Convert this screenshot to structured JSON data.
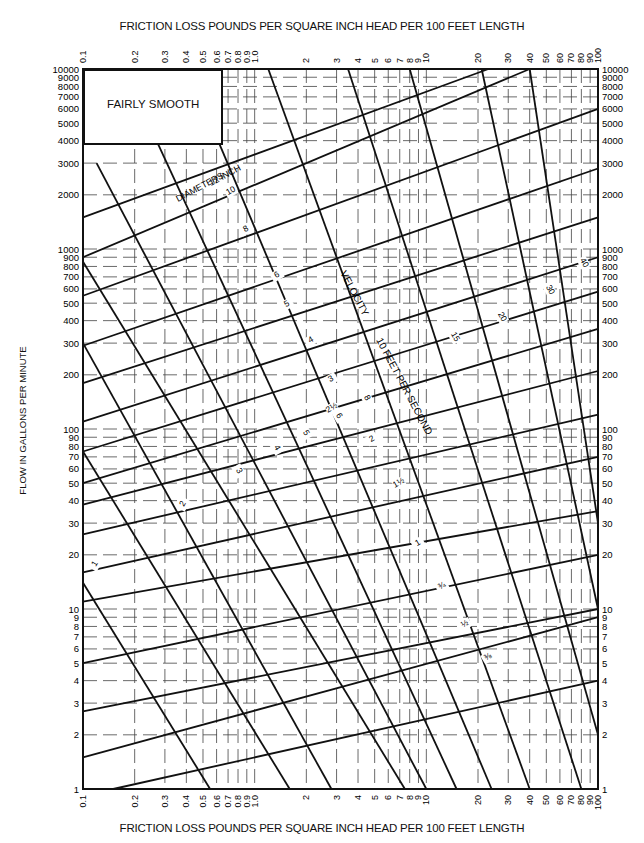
{
  "chart_data": {
    "type": "line",
    "title": "FRICTION LOSS POUNDS PER SQUARE INCH HEAD PER 100 FEET LENGTH",
    "xlabel": "FRICTION LOSS POUNDS PER SQUARE INCH HEAD PER 100 FEET LENGTH",
    "ylabel": "FLOW IN GALLONS PER MINUTE",
    "xscale": "log",
    "yscale": "log",
    "xlim": [
      0.1,
      100
    ],
    "ylim": [
      1,
      10000
    ],
    "grid": true,
    "legend": "FAIRLY SMOOTH",
    "x_ticks": [
      "0.1",
      "0.2",
      "0.3",
      "0.4",
      "0.5",
      "0.6",
      "0.7",
      "0.8",
      "0.9",
      "1.0",
      "2",
      "3",
      "4",
      "5",
      "6",
      "7",
      "8",
      "9",
      "10",
      "20",
      "30",
      "40",
      "50",
      "60",
      "70",
      "80",
      "90",
      "100"
    ],
    "y_ticks_left": [
      "10000",
      "9000",
      "8000",
      "7000",
      "6000",
      "5000",
      "4000",
      "3000",
      "2000",
      "1000",
      "900",
      "800",
      "700",
      "600",
      "500",
      "400",
      "300",
      "200",
      "100",
      "90",
      "80",
      "70",
      "60",
      "50",
      "40",
      "30",
      "20",
      "10",
      "9",
      "8",
      "7",
      "6",
      "5",
      "4",
      "3",
      "2",
      "1"
    ],
    "y_ticks_right": [
      "10000",
      "9000",
      "8000",
      "7000",
      "6000",
      "5000",
      "4000",
      "3000",
      "2000",
      "1000",
      "900",
      "800",
      "700",
      "600",
      "500",
      "400",
      "300",
      "200",
      "100",
      "90",
      "80",
      "70",
      "60",
      "50",
      "40",
      "30",
      "20",
      "10",
      "9",
      "8",
      "7",
      "6",
      "5",
      "4",
      "3",
      "2",
      "1"
    ],
    "diameter_series_label": "DIAMETERS 12 INCH",
    "velocity_series_label": "VELOCITY 10 FEET PER SECOND",
    "diameter_lines": [
      {
        "name": "12",
        "points": [
          [
            0.1,
            1500
          ],
          [
            23,
            10000
          ]
        ]
      },
      {
        "name": "10",
        "points": [
          [
            0.1,
            900
          ],
          [
            40,
            10000
          ]
        ]
      },
      {
        "name": "8",
        "points": [
          [
            0.1,
            550
          ],
          [
            100,
            6000
          ]
        ]
      },
      {
        "name": "6",
        "points": [
          [
            0.1,
            290
          ],
          [
            100,
            2800
          ]
        ]
      },
      {
        "name": "5",
        "points": [
          [
            0.1,
            180
          ],
          [
            100,
            1500
          ]
        ]
      },
      {
        "name": "4",
        "points": [
          [
            0.1,
            110
          ],
          [
            100,
            900
          ]
        ]
      },
      {
        "name": "3",
        "points": [
          [
            0.1,
            75
          ],
          [
            100,
            580
          ]
        ]
      },
      {
        "name": "2 1/2",
        "points": [
          [
            0.1,
            50
          ],
          [
            100,
            360
          ]
        ]
      },
      {
        "name": "2",
        "points": [
          [
            0.1,
            38
          ],
          [
            100,
            210
          ]
        ]
      },
      {
        "name": "1 1/2",
        "points": [
          [
            0.1,
            26
          ],
          [
            100,
            120
          ]
        ]
      },
      {
        "name": "1 1/4",
        "points": [
          [
            0.1,
            16
          ],
          [
            100,
            70
          ]
        ]
      },
      {
        "name": "1",
        "points": [
          [
            0.1,
            11
          ],
          [
            100,
            35
          ]
        ]
      },
      {
        "name": "3/4",
        "points": [
          [
            0.1,
            5
          ],
          [
            100,
            20
          ]
        ]
      },
      {
        "name": "1/2",
        "points": [
          [
            0.1,
            2.7
          ],
          [
            100,
            10
          ]
        ]
      },
      {
        "name": "3/8",
        "points": [
          [
            0.1,
            1.5
          ],
          [
            100,
            9
          ]
        ]
      },
      {
        "name": "1/4",
        "points": [
          [
            0.15,
            1
          ],
          [
            100,
            4
          ]
        ]
      }
    ],
    "velocity_lines": [
      {
        "name": "1",
        "points": [
          [
            0.1,
            14
          ],
          [
            0.55,
            1
          ]
        ]
      },
      {
        "name": "2",
        "points": [
          [
            0.1,
            75
          ],
          [
            1.6,
            1
          ]
        ]
      },
      {
        "name": "3",
        "points": [
          [
            0.1,
            300
          ],
          [
            2.8,
            1
          ]
        ]
      },
      {
        "name": "4",
        "points": [
          [
            0.1,
            850
          ],
          [
            7.5,
            1
          ]
        ]
      },
      {
        "name": "5",
        "points": [
          [
            0.12,
            3000
          ],
          [
            10,
            1
          ]
        ]
      },
      {
        "name": "6",
        "points": [
          [
            0.22,
            6000
          ],
          [
            15,
            1
          ]
        ]
      },
      {
        "name": "8",
        "points": [
          [
            0.45,
            8000
          ],
          [
            24,
            1
          ]
        ]
      },
      {
        "name": "10",
        "points": [
          [
            1.2,
            10000
          ],
          [
            40,
            1
          ]
        ]
      },
      {
        "name": "15",
        "points": [
          [
            3.5,
            10000
          ],
          [
            80,
            1
          ]
        ]
      },
      {
        "name": "20",
        "points": [
          [
            8,
            10000
          ],
          [
            100,
            2
          ]
        ]
      },
      {
        "name": "30",
        "points": [
          [
            21,
            10000
          ],
          [
            100,
            10
          ]
        ]
      },
      {
        "name": "40",
        "points": [
          [
            40,
            10000
          ],
          [
            100,
            30
          ]
        ]
      }
    ]
  },
  "text_labels": {
    "title_top": "FRICTION LOSS POUNDS PER SQUARE INCH HEAD PER 100 FEET LENGTH",
    "title_bottom": "FRICTION LOSS POUNDS PER SQUARE INCH HEAD PER 100 FEET LENGTH",
    "ylabel": "FLOW IN GALLONS PER MINUTE",
    "legend": "FAIRLY SMOOTH",
    "diameters": "DIAMETERS",
    "twelve_inch": "12   INCH",
    "velocity": "VELOCITY",
    "ten_feet_per_second": "10   FEET   PER   SECOND"
  },
  "line_labels": [
    {
      "text": "10",
      "x": 232,
      "y": 193,
      "rot": -30
    },
    {
      "text": "8",
      "x": 247,
      "y": 231,
      "rot": -30
    },
    {
      "text": "6",
      "x": 278,
      "y": 277,
      "rot": -30
    },
    {
      "text": "5",
      "x": 288,
      "y": 306,
      "rot": -30
    },
    {
      "text": "4",
      "x": 312,
      "y": 342,
      "rot": -30
    },
    {
      "text": "3",
      "x": 332,
      "y": 381,
      "rot": -30
    },
    {
      "text": "2½",
      "x": 333,
      "y": 410,
      "rot": -30
    },
    {
      "text": "2",
      "x": 373,
      "y": 441,
      "rot": -30
    },
    {
      "text": "1½",
      "x": 400,
      "y": 485,
      "rot": -30
    },
    {
      "text": "1",
      "x": 419,
      "y": 545,
      "rot": -30
    },
    {
      "text": "¾",
      "x": 443,
      "y": 588,
      "rot": -30
    },
    {
      "text": "½",
      "x": 466,
      "y": 626,
      "rot": -30
    },
    {
      "text": "⅜",
      "x": 489,
      "y": 659,
      "rot": -30
    },
    {
      "text": "1",
      "x": 97,
      "y": 565,
      "rot": -60
    },
    {
      "text": "2",
      "x": 185,
      "y": 505,
      "rot": -60
    },
    {
      "text": "3",
      "x": 237,
      "y": 472,
      "rot": 60
    },
    {
      "text": "4",
      "x": 275,
      "y": 449,
      "rot": 60
    },
    {
      "text": "5",
      "x": 304,
      "y": 434,
      "rot": 60
    },
    {
      "text": "6",
      "x": 337,
      "y": 417,
      "rot": 60
    },
    {
      "text": "8",
      "x": 365,
      "y": 399,
      "rot": 60
    },
    {
      "text": "15",
      "x": 453,
      "y": 338,
      "rot": 60
    },
    {
      "text": "20",
      "x": 500,
      "y": 318,
      "rot": 60
    },
    {
      "text": "30",
      "x": 548,
      "y": 291,
      "rot": 60
    },
    {
      "text": "40",
      "x": 582,
      "y": 264,
      "rot": 60
    }
  ]
}
